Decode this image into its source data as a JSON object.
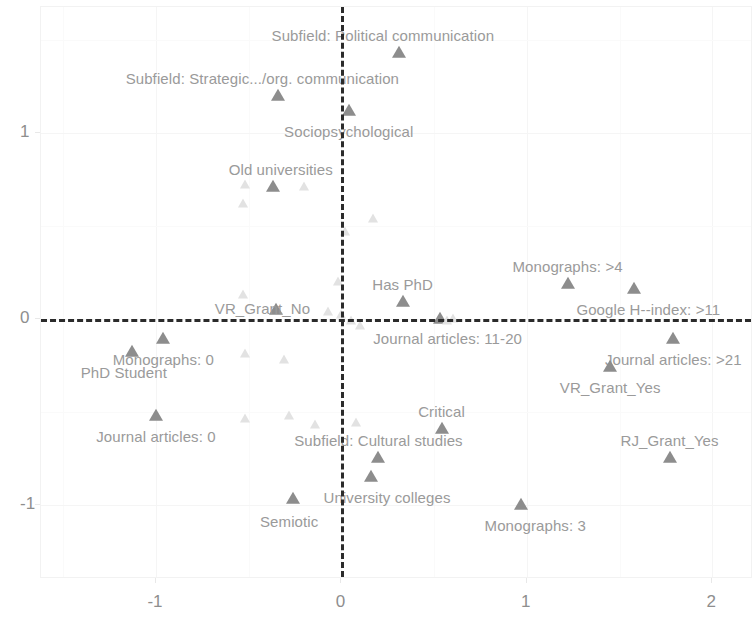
{
  "chart_data": {
    "type": "scatter",
    "title": "",
    "subtitle": "",
    "xlabel": "",
    "ylabel": "",
    "xlim": [
      -1.62,
      2.22
    ],
    "ylim": [
      -1.4,
      1.68
    ],
    "xticks": [
      "-1",
      "0",
      "1",
      "2"
    ],
    "xtick_values": [
      -1,
      0,
      1,
      2
    ],
    "yticks": [
      "1",
      "0",
      "-1"
    ],
    "ytick_values": [
      1,
      0,
      -1
    ],
    "grid": true,
    "legend": "none",
    "reference_lines": {
      "horizontal": 0,
      "vertical": 0,
      "style": "dashed",
      "color": "#2b2b2b"
    },
    "marker": {
      "shape": "triangle",
      "color": "#8d8d8d",
      "faint_color": "#e2e2e2"
    },
    "points": [
      {
        "label": "Subfield: Political communication",
        "x": 0.31,
        "y": 1.43,
        "label_dx": -16,
        "label_dy": -18,
        "faint": false
      },
      {
        "label": "Subfield: Strategic.../org. communication",
        "x": -0.34,
        "y": 1.2,
        "label_dx": -16,
        "label_dy": -18,
        "faint": false
      },
      {
        "label": "Sociopsychological",
        "x": 0.04,
        "y": 1.12,
        "label_dx": 0,
        "label_dy": 20,
        "faint": false
      },
      {
        "label": "Old universities",
        "x": -0.37,
        "y": 0.71,
        "label_dx": 8,
        "label_dy": -18,
        "faint": false
      },
      {
        "label": "Monographs: >4",
        "x": 1.22,
        "y": 0.19,
        "label_dx": 0,
        "label_dy": -18,
        "faint": false
      },
      {
        "label": "Google H--index: >11",
        "x": 1.58,
        "y": 0.16,
        "label_dx": 14,
        "label_dy": 20,
        "faint": false
      },
      {
        "label": "Has PhD",
        "x": 0.33,
        "y": 0.09,
        "label_dx": 0,
        "label_dy": -18,
        "faint": false
      },
      {
        "label": "VR_Grant_No",
        "x": -0.35,
        "y": 0.05,
        "label_dx": -14,
        "label_dy": -2,
        "faint": false
      },
      {
        "label": "Journal articles: 11-20",
        "x": 0.53,
        "y": 0.0,
        "label_dx": 8,
        "label_dy": 19,
        "faint": false
      },
      {
        "label": "Journal articles: >21",
        "x": 1.79,
        "y": -0.11,
        "label_dx": 0,
        "label_dy": 20,
        "faint": false
      },
      {
        "label": "Monographs: 0",
        "x": -0.96,
        "y": -0.11,
        "label_dx": 0,
        "label_dy": 20,
        "faint": false
      },
      {
        "label": "VR_Grant_Yes",
        "x": 1.45,
        "y": -0.26,
        "label_dx": 0,
        "label_dy": 20,
        "faint": false
      },
      {
        "label": "PhD Student",
        "x": -1.13,
        "y": -0.18,
        "label_dx": -8,
        "label_dy": 20,
        "faint": false
      },
      {
        "label": "Journal articles: 0",
        "x": -1.0,
        "y": -0.52,
        "label_dx": 0,
        "label_dy": 20,
        "faint": false
      },
      {
        "label": "Critical",
        "x": 0.54,
        "y": -0.59,
        "label_dx": 0,
        "label_dy": -18,
        "faint": false
      },
      {
        "label": "Subfield: Cultural studies",
        "x": 0.2,
        "y": -0.75,
        "label_dx": 0,
        "label_dy": -18,
        "faint": false
      },
      {
        "label": "RJ_Grant_Yes",
        "x": 1.77,
        "y": -0.75,
        "label_dx": 0,
        "label_dy": -18,
        "faint": false
      },
      {
        "label": "University colleges",
        "x": 0.16,
        "y": -0.85,
        "label_dx": 16,
        "label_dy": 20,
        "faint": false
      },
      {
        "label": "Semiotic",
        "x": -0.26,
        "y": -0.97,
        "label_dx": -4,
        "label_dy": 22,
        "faint": false
      },
      {
        "label": "Monographs: 3",
        "x": 0.97,
        "y": -1.0,
        "label_dx": 14,
        "label_dy": 20,
        "faint": false
      },
      {
        "label": "",
        "x": -0.52,
        "y": 0.72,
        "faint": true
      },
      {
        "label": "",
        "x": -0.53,
        "y": 0.62,
        "faint": true
      },
      {
        "label": "",
        "x": -0.53,
        "y": 0.13,
        "faint": true
      },
      {
        "label": "",
        "x": -0.52,
        "y": -0.19,
        "faint": true
      },
      {
        "label": "",
        "x": -0.52,
        "y": -0.54,
        "faint": true
      },
      {
        "label": "",
        "x": -0.28,
        "y": -0.52,
        "faint": true
      },
      {
        "label": "",
        "x": -0.2,
        "y": 0.71,
        "faint": true
      },
      {
        "label": "",
        "x": -0.02,
        "y": 0.2,
        "faint": true
      },
      {
        "label": "",
        "x": 0.0,
        "y": 0.02,
        "faint": true
      },
      {
        "label": "",
        "x": -0.07,
        "y": 0.04,
        "faint": true
      },
      {
        "label": "",
        "x": 0.02,
        "y": 0.47,
        "faint": true
      },
      {
        "label": "",
        "x": 0.05,
        "y": -0.01,
        "faint": true
      },
      {
        "label": "",
        "x": 0.1,
        "y": -0.04,
        "faint": true
      },
      {
        "label": "",
        "x": 0.17,
        "y": 0.54,
        "faint": true
      },
      {
        "label": "",
        "x": 0.08,
        "y": -0.56,
        "faint": true
      },
      {
        "label": "",
        "x": -0.14,
        "y": -0.57,
        "faint": true
      },
      {
        "label": "",
        "x": -0.31,
        "y": -0.22,
        "faint": true
      },
      {
        "label": "",
        "x": 0.57,
        "y": -0.01,
        "faint": true
      },
      {
        "label": "",
        "x": 0.6,
        "y": 0.0,
        "faint": true
      }
    ]
  },
  "axes": {
    "x_tick_labels": [
      "-1",
      "0",
      "1",
      "2"
    ],
    "y_tick_labels": [
      "1",
      "0",
      "-1"
    ]
  }
}
